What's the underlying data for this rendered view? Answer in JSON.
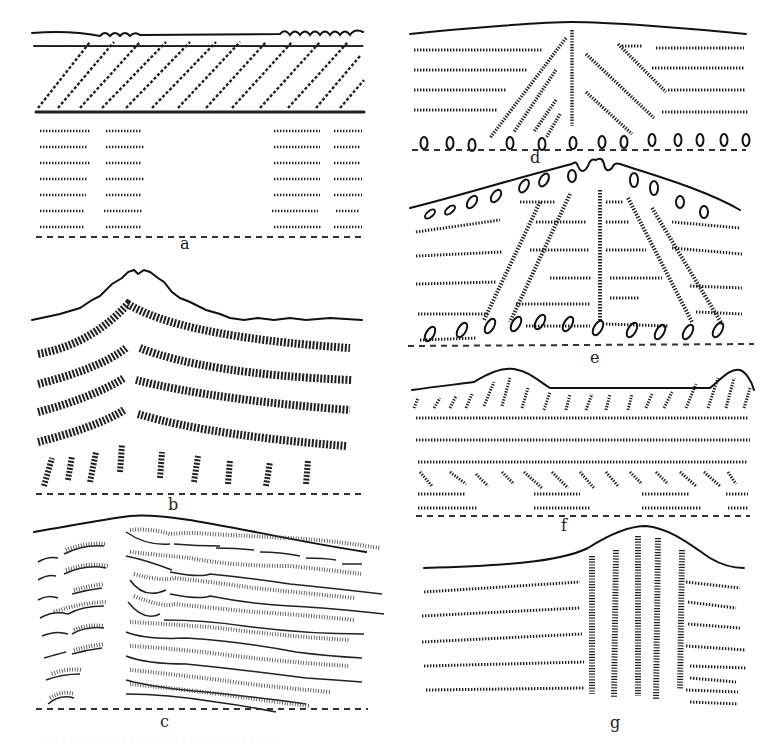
{
  "figure": {
    "ink_color": "#111111",
    "background": "#ffffff",
    "panels": [
      {
        "id": "a",
        "label": "a",
        "surface": "wavy",
        "layers": "diagonal hatched bands over two blocks of vertical tick rows with empty center"
      },
      {
        "id": "b",
        "label": "b",
        "surface": "single peak",
        "layers": "four chevron-shaped beaded bands bending at peak, row of spiral nodules below"
      },
      {
        "id": "c",
        "label": "c",
        "surface": "gentle rise",
        "layers": "lenticular hatched lenses, narrow left column and wide right field separated by gap"
      },
      {
        "id": "d",
        "label": "d",
        "surface": "flat, slight arch",
        "layers": "horizontal tick rows cut by fan of radiating hatched lines from center, row of ovoid nodules"
      },
      {
        "id": "e",
        "label": "e",
        "surface": "cone with central notch",
        "layers": "horizontal tick rows, five radiating hatched columns, nodules along surface and base"
      },
      {
        "id": "f",
        "label": "f",
        "surface": "two mounds",
        "layers": "slanted ticks under mounds, horizontal tick rows, second slanted band, short tick rows"
      },
      {
        "id": "g",
        "label": "g",
        "surface": "single dome",
        "layers": "horizontal tick rows on flanks, five vertical hatched columns under dome"
      }
    ]
  },
  "caption": "· · · · · · · · · · · · · · · · · · · · · · · · · · · · · · · ·"
}
